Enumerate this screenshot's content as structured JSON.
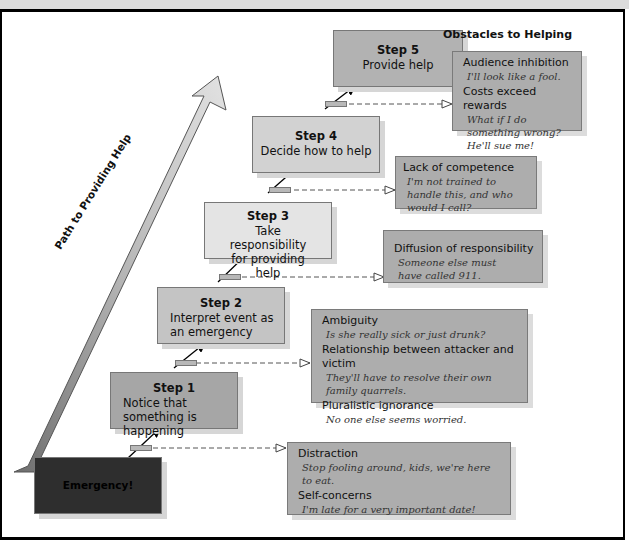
{
  "figure": {
    "path_label": "Path to Providing Help",
    "obstacles_heading": "Obstacles to Helping",
    "colors": {
      "emergency": "#2e2e2e",
      "step1": "#a6a6a6",
      "step2": "#c4c4c4",
      "step3": "#e4e4e4",
      "step4": "#d2d2d2",
      "step5": "#b2b2b2",
      "obstacle": "#adadad"
    }
  },
  "steps": [
    {
      "id": "emergency",
      "title": "Emergency!",
      "desc": ""
    },
    {
      "id": "step1",
      "title": "Step 1",
      "desc": "Notice that something is happening"
    },
    {
      "id": "step2",
      "title": "Step 2",
      "desc": "Interpret event as an emergency"
    },
    {
      "id": "step3",
      "title": "Step 3",
      "desc": "Take responsibility for providing help"
    },
    {
      "id": "step4",
      "title": "Step 4",
      "desc": "Decide how to help"
    },
    {
      "id": "step5",
      "title": "Step 5",
      "desc": "Provide help"
    }
  ],
  "obstacles": [
    {
      "items": [
        {
          "heading": "Distraction",
          "quote": "Stop fooling around, kids, we're here to eat."
        },
        {
          "heading": "Self-concerns",
          "quote": "I'm late for a very important date!"
        }
      ]
    },
    {
      "items": [
        {
          "heading": "Ambiguity",
          "quote": "Is she really sick or just drunk?"
        },
        {
          "heading": "Relationship between attacker and victim",
          "quote": "They'll have to resolve their own family quarrels."
        },
        {
          "heading": "Pluralistic ignorance",
          "quote": "No one else seems worried."
        }
      ]
    },
    {
      "items": [
        {
          "heading": "Diffusion of responsibility",
          "quote": "Someone else must have called 911."
        }
      ]
    },
    {
      "items": [
        {
          "heading": "Lack of competence",
          "quote": "I'm not trained to handle this, and who would I call?"
        }
      ]
    },
    {
      "items": [
        {
          "heading": "Audience inhibition",
          "quote": "I'll look like a fool."
        },
        {
          "heading": "Costs exceed rewards",
          "quote": "What if I do something wrong? He'll sue me!"
        }
      ]
    }
  ]
}
